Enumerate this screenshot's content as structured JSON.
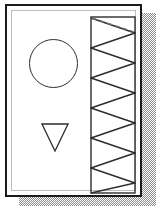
{
  "document": {
    "title": "Slide page with shapes",
    "page_background_color": "#ffffff",
    "page_border_color": "#1b1b1b",
    "page_inner_border_color": "#bdbdbd",
    "shadow_color": "#8d8d8d",
    "shadow_style": "checkered-dither"
  },
  "shapes": [
    {
      "name": "circle",
      "label": "Circle outline",
      "stroke_color": "#2e2e2e",
      "fill": "none",
      "cx": 46.5,
      "cy": 57.5,
      "r": 24.5
    },
    {
      "name": "triangle",
      "label": "Downward pointing triangle outline",
      "stroke_color": "#2e2e2e",
      "fill": "none",
      "points": "1,1 27,1 14,28",
      "direction": "down"
    },
    {
      "name": "zigzag-panel",
      "label": "Rectangle with zigzag sawtooth pattern",
      "stroke_color": "#2e2e2e",
      "fill": "none",
      "rect": {
        "x": 0,
        "y": 0,
        "width": 46,
        "height": 178
      },
      "teeth_count": 6,
      "zigzag_points": "1,2 45,17 1,32 45,47 1,62 45,77 1,92 45,107 1,122 45,137 1,152 45,167 1,177",
      "top_dash_points": "2,2 44,16"
    }
  ]
}
